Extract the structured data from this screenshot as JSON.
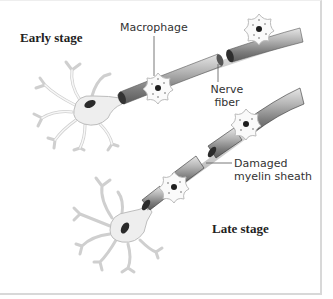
{
  "diagram": {
    "stages": {
      "early": "Early stage",
      "late": "Late stage"
    },
    "labels": {
      "macrophage": "Macrophage",
      "nerve_fiber_line1": "Nerve",
      "nerve_fiber_line2": "fiber",
      "damaged_line1": "Damaged",
      "damaged_line2": "myelin sheath"
    },
    "colors": {
      "sheath_dark": "#3a3a3a",
      "sheath_mid": "#8a8a8a",
      "sheath_light": "#d0d0d0",
      "cell_fill": "#efefef",
      "cell_outline": "#b8b8b8",
      "nucleus": "#2a2a2a",
      "frame_border": "#d8d8d8"
    }
  }
}
